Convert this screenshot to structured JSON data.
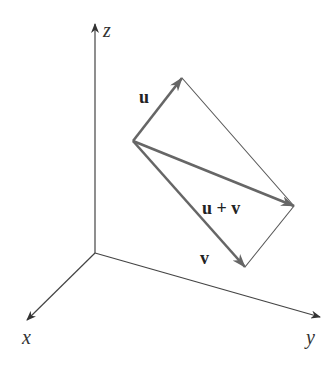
{
  "diagram": {
    "axes": {
      "x": {
        "label": "x"
      },
      "y": {
        "label": "y"
      },
      "z": {
        "label": "z"
      }
    },
    "vectors": [
      {
        "name": "u",
        "label": "u"
      },
      {
        "name": "v",
        "label": "v"
      },
      {
        "name": "u_plus_v",
        "label": "u + v"
      }
    ],
    "colors": {
      "axis": "#333333",
      "vector": "#666666",
      "parallelogram_edge": "#555555",
      "text": "#222222"
    }
  }
}
